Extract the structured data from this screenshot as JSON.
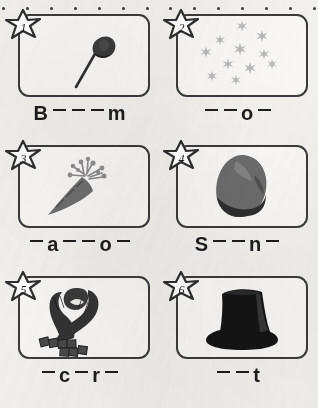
{
  "worksheet": {
    "title": "Winter Picture Word Fill-in Worksheet",
    "ink_color": "#3b3b3b",
    "paper_color": "#f2f1ee",
    "perforation_dots": 14
  },
  "items": [
    {
      "number": "1",
      "picture": "broom",
      "picture_label": "broom-illustration",
      "answer_pattern": "B___m",
      "given_letters": [
        "B",
        "m"
      ],
      "blank_count": 3,
      "answer_text": "B _ _ _ m"
    },
    {
      "number": "2",
      "picture": "snowflakes",
      "picture_label": "snowflakes-illustration",
      "answer_pattern": "__o_",
      "given_letters": [
        "o"
      ],
      "blank_count": 3,
      "answer_text": "_ _ o _"
    },
    {
      "number": "3",
      "picture": "carrot",
      "picture_label": "carrot-illustration",
      "answer_pattern": "_a__o_",
      "given_letters": [
        "a",
        "o"
      ],
      "blank_count": 4,
      "answer_text": "_ a _ _ o _"
    },
    {
      "number": "4",
      "picture": "stone",
      "picture_label": "stone-illustration",
      "answer_pattern": "S__n_",
      "given_letters": [
        "S",
        "n"
      ],
      "blank_count": 3,
      "answer_text": "S _ _ n _"
    },
    {
      "number": "5",
      "picture": "scarf",
      "picture_label": "scarf-illustration",
      "answer_pattern": "_c_r_",
      "given_letters": [
        "c",
        "r"
      ],
      "blank_count": 3,
      "answer_text": "_ c _ r _"
    },
    {
      "number": "6",
      "picture": "hat",
      "picture_label": "hat-illustration",
      "answer_pattern": "__t",
      "given_letters": [
        "t"
      ],
      "blank_count": 2,
      "answer_text": "_ _ t"
    }
  ]
}
